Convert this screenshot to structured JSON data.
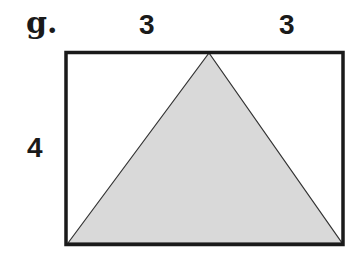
{
  "problem": {
    "label": "g.",
    "top_left_segment": "3",
    "top_right_segment": "3",
    "height_label": "4"
  },
  "figure": {
    "shape": "rectangle with inscribed triangle",
    "rectangle": {
      "width_units": 6,
      "height_units": 4
    },
    "triangle": {
      "base": "bottom edge of rectangle",
      "apex": "midpoint of top edge",
      "fill": "#d9d9d9"
    },
    "stroke_color": "#1a1a1a"
  }
}
